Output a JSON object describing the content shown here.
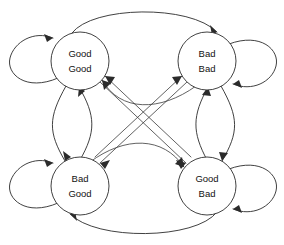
{
  "diagram": {
    "type": "state-transition-graph",
    "canvas": {
      "width": 284,
      "height": 245
    },
    "stroke_color": "#2b2b2b",
    "node_fill": "#ffffff",
    "label_color": "#111111",
    "nodes": [
      {
        "id": "good-good",
        "line1": "Good",
        "line2": "Good",
        "cx": 80,
        "cy": 61,
        "r": 29,
        "position": "top-left"
      },
      {
        "id": "bad-bad",
        "line1": "Bad",
        "line2": "Bad",
        "cx": 207,
        "cy": 61,
        "r": 29,
        "position": "top-right"
      },
      {
        "id": "bad-good",
        "line1": "Bad",
        "line2": "Good",
        "cx": 80,
        "cy": 186,
        "r": 29,
        "position": "bottom-left"
      },
      {
        "id": "good-bad",
        "line1": "Good",
        "line2": "Bad",
        "cx": 207,
        "cy": 186,
        "r": 29,
        "position": "bottom-right"
      }
    ],
    "edges": [
      {
        "from": "good-good",
        "to": "good-good",
        "kind": "self-loop",
        "side": "left"
      },
      {
        "from": "bad-bad",
        "to": "bad-bad",
        "kind": "self-loop",
        "side": "right"
      },
      {
        "from": "bad-good",
        "to": "bad-good",
        "kind": "self-loop",
        "side": "left"
      },
      {
        "from": "good-bad",
        "to": "good-bad",
        "kind": "self-loop",
        "side": "right"
      },
      {
        "from": "good-good",
        "to": "bad-bad",
        "kind": "arc",
        "side": "top"
      },
      {
        "from": "good-bad",
        "to": "bad-good",
        "kind": "arc",
        "side": "bottom"
      },
      {
        "from": "good-good",
        "to": "bad-good",
        "kind": "curve",
        "side": "left-vertical"
      },
      {
        "from": "bad-good",
        "to": "good-good",
        "kind": "curve",
        "side": "left-vertical"
      },
      {
        "from": "bad-bad",
        "to": "good-bad",
        "kind": "curve",
        "side": "right-vertical"
      },
      {
        "from": "good-bad",
        "to": "bad-bad",
        "kind": "curve",
        "side": "right-vertical"
      },
      {
        "from": "good-good",
        "to": "good-bad",
        "kind": "diagonal",
        "side": "center"
      },
      {
        "from": "good-bad",
        "to": "good-good",
        "kind": "diagonal",
        "side": "center"
      },
      {
        "from": "bad-bad",
        "to": "bad-good",
        "kind": "diagonal",
        "side": "center"
      },
      {
        "from": "bad-good",
        "to": "bad-bad",
        "kind": "diagonal",
        "side": "center"
      },
      {
        "from": "good-good",
        "to": "bad-bad",
        "kind": "shallow-curve",
        "side": "upper-middle"
      },
      {
        "from": "bad-good",
        "to": "good-bad",
        "kind": "shallow-curve",
        "side": "lower-middle"
      }
    ]
  }
}
